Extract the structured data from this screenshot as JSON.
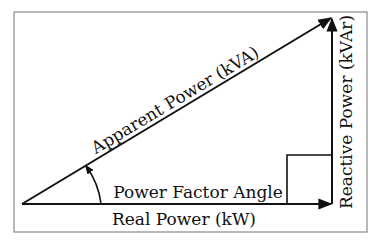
{
  "diagram": {
    "labels": {
      "hypotenuse": "Apparent Power (kVA)",
      "base": "Real Power (kW)",
      "vertical": "Reactive Power (kVAr)",
      "angle": "Power Factor Angle"
    },
    "colors": {
      "line": "#111111",
      "frame": "#8a8a8a",
      "background": "#ffffff"
    }
  }
}
